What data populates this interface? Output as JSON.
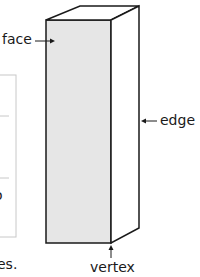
{
  "diagram": {
    "colors": {
      "face_fill": "#e6e6e6",
      "edge_stroke": "#1a1a1a",
      "box_stroke": "#c8c8c8"
    },
    "labels": {
      "face": "face",
      "edge": "edge",
      "vertex": "vertex"
    },
    "partial_text": {
      "left_cut_char": "o",
      "bottom_cut_text": "es."
    }
  }
}
